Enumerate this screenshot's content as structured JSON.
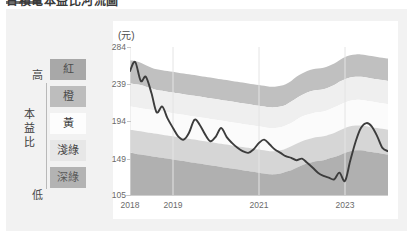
{
  "headline": {
    "text": "台積電本益比河流圖",
    "rule_color": "#6e6e6e"
  },
  "legend": {
    "axis_title": "本益比",
    "axis_title_chars": [
      "本",
      "益",
      "比"
    ],
    "high_label": "高",
    "low_label": "低",
    "bands": [
      {
        "label": "紅",
        "name": "red-band",
        "color": "#a8a8a8",
        "true_color": "#e8504a"
      },
      {
        "label": "橙",
        "name": "orange-band",
        "color": "#bdbdbd",
        "true_color": "#f0a03c"
      },
      {
        "label": "黃",
        "name": "yellow-band",
        "color": "#fdfdfd",
        "true_color": "#f5e05a"
      },
      {
        "label": "淺綠",
        "name": "light-green-band",
        "color": "#e7e7e7",
        "true_color": "#a8d98a"
      },
      {
        "label": "深綠",
        "name": "dark-green-band",
        "color": "#b3b3b3",
        "true_color": "#4a9e5c"
      }
    ]
  },
  "chart_data": {
    "type": "area",
    "title": "台積電本益比河流圖",
    "subtitle": "",
    "unit_label": "(元)",
    "xlabel": "",
    "ylabel": "(元)",
    "ylim": [
      105,
      284
    ],
    "yticks": [
      105,
      149,
      194,
      239,
      284
    ],
    "ytick_labels": [
      "105",
      "149",
      "194",
      "239",
      "284"
    ],
    "xlim": [
      2018.0,
      2024.0
    ],
    "xticks": [
      2018,
      2019,
      2021,
      2023
    ],
    "xtick_labels": [
      "2018",
      "2019",
      "2021",
      "2023"
    ],
    "grid": "vertical-only",
    "legend_position": "left",
    "band_colors": [
      "#9d9d9d",
      "#c0c0c0",
      "#efefef",
      "#fbfbfb",
      "#d6d6d6",
      "#b0b0b0"
    ],
    "line_color": "#3c3c3c",
    "plot_bg": "#ffffff",
    "x": [
      2018.0,
      2018.12,
      2018.25,
      2018.37,
      2018.5,
      2018.62,
      2018.75,
      2018.87,
      2019.0,
      2019.12,
      2019.25,
      2019.37,
      2019.5,
      2019.62,
      2019.75,
      2019.87,
      2020.0,
      2020.12,
      2020.25,
      2020.37,
      2020.5,
      2020.62,
      2020.75,
      2020.87,
      2021.0,
      2021.12,
      2021.25,
      2021.37,
      2021.5,
      2021.62,
      2021.75,
      2021.87,
      2022.0,
      2022.12,
      2022.25,
      2022.37,
      2022.5,
      2022.62,
      2022.75,
      2022.87,
      2023.0,
      2023.12,
      2023.25,
      2023.37,
      2023.5,
      2023.62,
      2023.75,
      2023.87,
      2024.0
    ],
    "bands": [
      {
        "name": "紅",
        "upper_boundary_label": "最高本益比",
        "values": [
          268,
          267,
          265,
          262,
          259,
          257,
          256,
          255,
          254,
          253,
          252,
          251,
          250,
          249,
          248,
          247,
          246,
          245,
          244,
          243,
          242,
          241,
          240,
          239,
          238,
          237,
          236,
          236,
          237,
          239,
          243,
          248,
          252,
          255,
          257,
          258,
          259,
          261,
          264,
          268,
          272,
          274,
          275,
          275,
          274,
          273,
          272,
          271,
          270
        ]
      },
      {
        "name": "橙",
        "values": [
          240,
          239,
          238,
          236,
          234,
          232,
          231,
          230,
          229,
          228,
          227,
          226,
          225,
          224,
          223,
          222,
          221,
          220,
          219,
          218,
          217,
          216,
          215,
          214,
          213,
          212,
          211,
          211,
          212,
          214,
          218,
          222,
          226,
          229,
          231,
          232,
          233,
          235,
          238,
          242,
          245,
          247,
          248,
          248,
          247,
          246,
          245,
          244,
          243
        ]
      },
      {
        "name": "黃",
        "values": [
          212,
          211,
          210,
          209,
          208,
          207,
          206,
          205,
          204,
          203,
          202,
          201,
          200,
          199,
          198,
          197,
          196,
          195,
          194,
          193,
          192,
          191,
          190,
          189,
          188,
          187,
          186,
          186,
          187,
          189,
          192,
          196,
          200,
          202,
          204,
          205,
          206,
          208,
          211,
          214,
          217,
          219,
          220,
          220,
          219,
          218,
          217,
          216,
          215
        ]
      },
      {
        "name": "淺綠",
        "values": [
          184,
          183,
          182,
          181,
          180,
          179,
          178,
          177,
          176,
          175,
          174,
          173,
          172,
          171,
          170,
          169,
          168,
          167,
          166,
          165,
          164,
          163,
          162,
          161,
          160,
          159,
          158,
          158,
          159,
          161,
          164,
          167,
          170,
          172,
          174,
          175,
          176,
          178,
          180,
          183,
          186,
          188,
          189,
          189,
          188,
          187,
          186,
          185,
          184
        ]
      },
      {
        "name": "深綠",
        "lower_boundary_label": "最低本益比",
        "values": [
          156,
          155,
          154,
          153,
          152,
          151,
          150,
          149,
          148,
          147,
          146,
          145,
          144,
          143,
          142,
          141,
          140,
          139,
          138,
          137,
          136,
          135,
          134,
          133,
          132,
          131,
          130,
          130,
          131,
          133,
          135,
          138,
          141,
          143,
          145,
          146,
          147,
          149,
          151,
          153,
          156,
          158,
          159,
          159,
          158,
          157,
          156,
          155,
          154
        ]
      }
    ],
    "series": [
      {
        "name": "股價",
        "type": "line",
        "color": "#3c3c3c",
        "values": [
          255,
          266,
          243,
          248,
          228,
          205,
          212,
          198,
          186,
          176,
          172,
          180,
          196,
          190,
          178,
          170,
          176,
          186,
          175,
          168,
          162,
          158,
          156,
          160,
          168,
          172,
          166,
          160,
          156,
          152,
          150,
          147,
          149,
          144,
          138,
          132,
          128,
          126,
          124,
          132,
          122,
          146,
          170,
          186,
          192,
          188,
          176,
          162,
          158
        ]
      }
    ]
  }
}
